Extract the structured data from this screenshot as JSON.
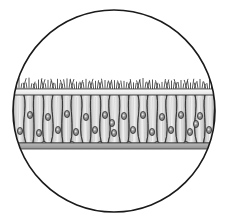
{
  "figure": {
    "caption": "",
    "view": "microscope-field-circular",
    "background_color": "#ffffff"
  },
  "field": {
    "shape": "circle",
    "center_x": 114,
    "center_y": 111,
    "radius": 101,
    "outline_color": "#1a1a1a",
    "outline_width": 1.6,
    "fill_color": "#ffffff"
  },
  "tissue": {
    "name": "epithelial-sheet",
    "left_x": 4,
    "right_x": 224,
    "cilia_top_y": 84,
    "apical_y": 95,
    "basal_y": 143,
    "membrane_bottom_y": 149,
    "cell_fill_light": "#f2f2f2",
    "cell_fill_mid": "#c8c8c8",
    "cell_fill_dark": "#9a9a9a",
    "cell_outline_color": "#2b2b2b",
    "cell_outline_width": 0.9,
    "basement_membrane_color": "#a8a8a8",
    "basement_membrane_outline": "#3a3a3a",
    "apical_band_color": "#ededed",
    "cilia_color": "#2b2b2b",
    "cilia_width": 0.8,
    "nucleus_fill": "#8c8c8c",
    "nucleus_outline": "#222222",
    "nucleolus_fill": "#efefef"
  },
  "cells": {
    "count": 23,
    "boundaries_x": [
      4,
      14,
      24,
      34,
      43,
      53,
      62,
      72,
      81,
      91,
      100,
      110,
      119,
      129,
      138,
      148,
      157,
      167,
      176,
      186,
      195,
      205,
      214,
      224
    ],
    "waist_offsets": [
      3,
      -3,
      4,
      -2,
      3,
      -4,
      2,
      -3,
      4,
      -2,
      3,
      -4,
      3,
      -2,
      4,
      -3,
      2,
      -4,
      3,
      -2,
      4,
      -3,
      2,
      -3
    ]
  },
  "nuclei": {
    "count": 34,
    "rx": 2.6,
    "ry": 3.6,
    "upper_row_y": 116,
    "lower_row_y": 131,
    "positions": [
      {
        "x": 10,
        "y": 118
      },
      {
        "x": 20,
        "y": 131
      },
      {
        "x": 30,
        "y": 115
      },
      {
        "x": 39,
        "y": 133
      },
      {
        "x": 48,
        "y": 117
      },
      {
        "x": 58,
        "y": 130
      },
      {
        "x": 67,
        "y": 114
      },
      {
        "x": 76,
        "y": 132
      },
      {
        "x": 86,
        "y": 117
      },
      {
        "x": 95,
        "y": 130
      },
      {
        "x": 105,
        "y": 115
      },
      {
        "x": 114,
        "y": 133
      },
      {
        "x": 124,
        "y": 116
      },
      {
        "x": 133,
        "y": 130
      },
      {
        "x": 143,
        "y": 115
      },
      {
        "x": 152,
        "y": 132
      },
      {
        "x": 162,
        "y": 117
      },
      {
        "x": 171,
        "y": 130
      },
      {
        "x": 181,
        "y": 115
      },
      {
        "x": 190,
        "y": 132
      },
      {
        "x": 200,
        "y": 116
      },
      {
        "x": 209,
        "y": 130
      },
      {
        "x": 218,
        "y": 117
      },
      {
        "x": 15,
        "y": 145
      },
      {
        "x": 44,
        "y": 145
      },
      {
        "x": 72,
        "y": 145
      },
      {
        "x": 100,
        "y": 145
      },
      {
        "x": 129,
        "y": 145
      },
      {
        "x": 157,
        "y": 145
      },
      {
        "x": 186,
        "y": 145
      },
      {
        "x": 214,
        "y": 145
      },
      {
        "x": 6,
        "y": 125
      },
      {
        "x": 112,
        "y": 123
      },
      {
        "x": 196,
        "y": 124
      }
    ]
  },
  "cilia": {
    "tuft_count": 23,
    "strands_per_tuft": 5,
    "length_min": 6,
    "length_max": 12,
    "spread_degrees": 34
  },
  "labels": {
    "cilia": "cilia",
    "nucleus": "nucleus",
    "basement_membrane": "basement membrane",
    "columnar_cell": "columnar cell"
  }
}
